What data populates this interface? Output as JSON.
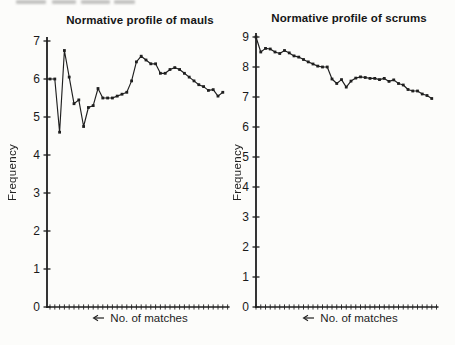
{
  "page": {
    "background_color": "#fcfcfa",
    "ink_color": "#1f1f1f",
    "top_edge_artifact": "illegible cropped text fragment from previous printed line"
  },
  "chart_data": [
    {
      "type": "line",
      "title": "Normative profile of mauls",
      "ylabel": "Frequency",
      "legend": {
        "label": "No. of matches",
        "marker_icon": "left-arrow-line-icon",
        "position": "below-x-axis"
      },
      "ylim": [
        0,
        7
      ],
      "yticks": [
        0,
        1,
        2,
        3,
        4,
        5,
        6,
        7
      ],
      "xticks": {
        "count": 38,
        "labeled": false,
        "x_meaning": "match number"
      },
      "grid": false,
      "line_color": "#1f1f1f",
      "marker": "small-filled-square",
      "values": [
        6.0,
        6.0,
        4.6,
        6.75,
        6.05,
        5.35,
        5.45,
        4.75,
        5.25,
        5.3,
        5.75,
        5.5,
        5.5,
        5.5,
        5.55,
        5.6,
        5.65,
        5.95,
        6.45,
        6.6,
        6.5,
        6.4,
        6.4,
        6.15,
        6.15,
        6.25,
        6.3,
        6.25,
        6.15,
        6.05,
        5.95,
        5.85,
        5.8,
        5.7,
        5.72,
        5.55,
        5.65
      ]
    },
    {
      "type": "line",
      "title": "Normative profile of scrums",
      "ylabel": "Frequency",
      "legend": {
        "label": "No. of matches",
        "marker_icon": "left-arrow-line-icon",
        "position": "below-x-axis"
      },
      "ylim": [
        0,
        9
      ],
      "yticks": [
        0,
        1,
        2,
        3,
        4,
        5,
        6,
        7,
        8,
        9
      ],
      "xticks": {
        "count": 39,
        "labeled": false,
        "x_meaning": "match number"
      },
      "grid": false,
      "line_color": "#1f1f1f",
      "marker": "small-filled-square",
      "values": [
        9.0,
        8.5,
        8.62,
        8.6,
        8.5,
        8.45,
        8.55,
        8.47,
        8.37,
        8.33,
        8.25,
        8.17,
        8.1,
        8.03,
        8.0,
        8.0,
        7.6,
        7.45,
        7.58,
        7.33,
        7.53,
        7.63,
        7.67,
        7.65,
        7.62,
        7.62,
        7.58,
        7.62,
        7.52,
        7.57,
        7.45,
        7.4,
        7.25,
        7.2,
        7.2,
        7.1,
        7.05,
        6.95
      ]
    }
  ]
}
